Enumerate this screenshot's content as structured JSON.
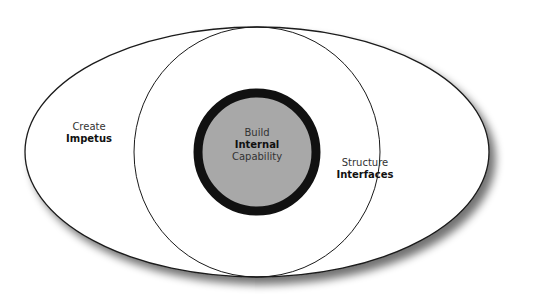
{
  "diagram": {
    "outer": {
      "line1": "Create",
      "line2": "Impetus"
    },
    "middle": {
      "line1": "Structure",
      "line2": "Interfaces"
    },
    "core": {
      "line1": "Build",
      "line2": "Internal",
      "line3": "Capability"
    }
  },
  "colors": {
    "core_fill": "#a8a8a8",
    "core_ring": "#111111",
    "stroke": "#1a1a1a",
    "background": "#ffffff"
  }
}
